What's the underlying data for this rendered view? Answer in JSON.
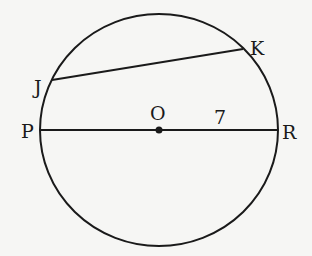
{
  "diagram": {
    "type": "circle-geometry",
    "colors": {
      "background": "#f6f6f4",
      "stroke": "#1a1a1a"
    },
    "circle": {
      "center_label": "O",
      "cx": 159,
      "cy": 130,
      "rx": 119,
      "ry": 116
    },
    "points": {
      "J": {
        "label": "J",
        "x": 52,
        "y": 80
      },
      "K": {
        "label": "K",
        "x": 243,
        "y": 49
      },
      "P": {
        "label": "P",
        "x": 40,
        "y": 130
      },
      "R": {
        "label": "R",
        "x": 278,
        "y": 130
      },
      "O": {
        "label": "O",
        "x": 159,
        "y": 130
      }
    },
    "segments": [
      {
        "name": "chord-JK",
        "from": "J",
        "to": "K"
      },
      {
        "name": "diameter-PR",
        "from": "P",
        "to": "R"
      }
    ],
    "annotations": {
      "radius_value": "7"
    }
  }
}
